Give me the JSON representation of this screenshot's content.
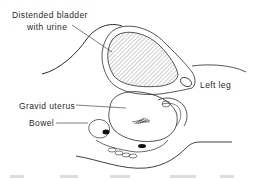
{
  "figure": {
    "labels": {
      "bladder_line1": "Distended bladder",
      "bladder_line2": "with urine",
      "left_leg": "Left leg",
      "gravid_uterus": "Gravid uterus",
      "bowel": "Bowel"
    },
    "colors": {
      "ink": "#2a2a2a",
      "background": "#ffffff",
      "hatch": "#555555"
    }
  }
}
